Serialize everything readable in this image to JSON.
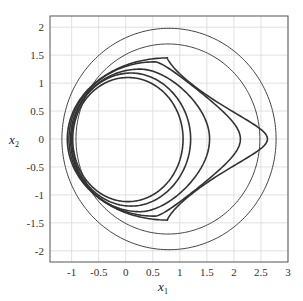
{
  "chart_data": {
    "type": "line",
    "title": "",
    "xlabel": "x",
    "xlabel_sub": "1",
    "ylabel": "x",
    "ylabel_sub": "2",
    "xlim": [
      -1.4,
      3
    ],
    "ylim": [
      -2.2,
      2.2
    ],
    "grid": true,
    "legend": null,
    "x_ticks": [
      -1,
      -0.5,
      0,
      0.5,
      1,
      1.5,
      2,
      2.5,
      3
    ],
    "x_tick_labels": [
      "-1",
      "-0.5",
      "0",
      "0.5",
      "1",
      "1.5",
      "2",
      "2.5",
      "3"
    ],
    "y_ticks": [
      2,
      1.5,
      1,
      0.5,
      0,
      -0.5,
      -1,
      -1.5,
      -2
    ],
    "y_tick_labels": [
      "2",
      "1.5",
      "1",
      "0.5",
      "0",
      "-0.5",
      "-1",
      "-1.5",
      "-2"
    ],
    "series": [
      {
        "name": "circle-outer",
        "shape": "circle",
        "center": [
          0.8,
          0
        ],
        "radius": 1.98,
        "stroke": "#444444",
        "width": 1.0
      },
      {
        "name": "circle-inner",
        "shape": "circle",
        "center": [
          0.78,
          0
        ],
        "radius": 1.7,
        "stroke": "#444444",
        "width": 1.0
      },
      {
        "name": "orbit-1",
        "shape": "closed-curve",
        "x_min": -1.08,
        "x_max": 2.62,
        "y_max": 1.45,
        "y_min": -1.45,
        "stroke": "#333333",
        "width": 1.6
      },
      {
        "name": "orbit-2",
        "shape": "closed-curve",
        "x_min": -1.05,
        "x_max": 2.12,
        "y_max": 1.38,
        "y_min": -1.38,
        "stroke": "#333333",
        "width": 1.6
      },
      {
        "name": "orbit-3",
        "shape": "closed-curve",
        "x_min": -1.02,
        "x_max": 1.55,
        "y_max": 1.25,
        "y_min": -1.3,
        "stroke": "#333333",
        "width": 1.6
      },
      {
        "name": "orbit-4",
        "shape": "closed-curve",
        "x_min": -1.0,
        "x_max": 1.2,
        "y_max": 1.18,
        "y_min": -1.2,
        "stroke": "#333333",
        "width": 1.6
      },
      {
        "name": "orbit-5",
        "shape": "closed-curve",
        "x_min": -0.98,
        "x_max": 1.06,
        "y_max": 1.1,
        "y_min": -1.12,
        "stroke": "#333333",
        "width": 1.6
      }
    ]
  },
  "plot": {
    "background": "#ffffff",
    "grid_color": "#d9d9d9",
    "axis_color": "#555555"
  }
}
